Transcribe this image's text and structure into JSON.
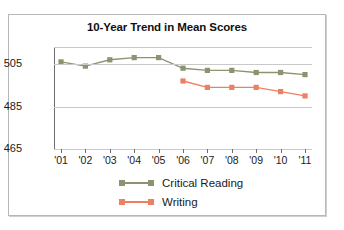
{
  "chart_data": {
    "type": "line",
    "title": "10-Year Trend in Mean Scores",
    "xlabel": "",
    "ylabel": "",
    "categories": [
      "'01",
      "'02",
      "'03",
      "'04",
      "'05",
      "'06",
      "'07",
      "'08",
      "'09",
      "'10",
      "'11"
    ],
    "ylim": [
      465,
      513
    ],
    "yticks": [
      465,
      485,
      505
    ],
    "ytick_labels": [
      "465",
      "485",
      "505"
    ],
    "grid": true,
    "legend_position": "bottom",
    "series": [
      {
        "name": "Critical Reading",
        "color": "#8b9470",
        "marker": "square",
        "values": [
          506,
          504,
          507,
          508,
          508,
          503,
          502,
          502,
          501,
          501,
          500
        ]
      },
      {
        "name": "Writing",
        "color": "#ec8060",
        "marker": "square",
        "values": [
          null,
          null,
          null,
          null,
          null,
          497,
          494,
          494,
          494,
          492,
          490
        ]
      }
    ]
  },
  "legend": {
    "items": [
      {
        "label": "Critical Reading",
        "color": "#8b9470"
      },
      {
        "label": "Writing",
        "color": "#ec8060"
      }
    ]
  },
  "colors": {
    "critical_reading": "#8b9470",
    "writing": "#ec8060",
    "gridline": "#c9c9c9",
    "axis": "#6d6d6d",
    "frame": "#b7b7b7",
    "text": "#1a1a1a"
  }
}
